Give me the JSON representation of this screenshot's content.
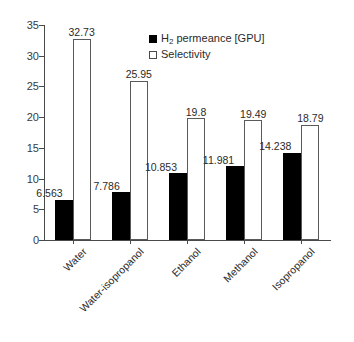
{
  "chart_data": {
    "type": "bar",
    "title": "",
    "subtitle": "",
    "xlabel": "",
    "ylabel": "",
    "categories": [
      "Water",
      "Water-isopropanol",
      "Ethanol",
      "Methanol",
      "Isopropanol"
    ],
    "series": [
      {
        "name": "H2 permeance [GPU]",
        "name_html_prefix": "H",
        "name_html_sub": "2",
        "name_html_suffix": " permeance [GPU]",
        "color": "#000000",
        "style": "filled",
        "values": [
          6.563,
          7.786,
          10.853,
          11.981,
          14.238
        ],
        "labels": [
          "6.563",
          "7.786",
          "10.853",
          "11.981",
          "14.238"
        ]
      },
      {
        "name": "Selectivity",
        "color": "#ffffff",
        "style": "open",
        "values": [
          32.73,
          25.95,
          19.8,
          19.49,
          18.79
        ],
        "labels": [
          "32.73",
          "25.95",
          "19.8",
          "19.49",
          "18.79"
        ]
      }
    ],
    "ylim": [
      0,
      35
    ],
    "yticks": [
      0,
      5,
      10,
      15,
      20,
      25,
      30,
      35
    ],
    "ytick_labels": [
      "0",
      "5",
      "10",
      "15",
      "20",
      "25",
      "30",
      "35"
    ],
    "grid": false,
    "legend_position": "top-center",
    "xtick_label_rotation": -45,
    "axis_color": "#4a4a4a",
    "text_color": "#2b2b2b"
  },
  "legend": {
    "entries": [
      {
        "label": "H2 permeance [GPU]",
        "swatch": "filled-square-black"
      },
      {
        "label": "Selectivity",
        "swatch": "open-square-white"
      }
    ]
  }
}
